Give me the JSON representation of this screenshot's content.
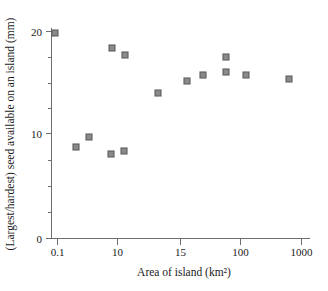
{
  "chart_data": {
    "type": "scatter",
    "title": "",
    "xlabel": "Area of island (km²)",
    "ylabel": "(Largest/hardest) seed available on an island (mm)",
    "xscale": "log-like-categorical",
    "x_tick_labels": [
      "0.1",
      "10",
      "15",
      "100",
      "1000"
    ],
    "y_tick_labels": [
      "0",
      "10",
      "20"
    ],
    "ylim": [
      0,
      21
    ],
    "y_major_ticks": [
      0,
      10,
      20
    ],
    "y_minor_ticks": [
      2.5,
      5,
      7.5,
      12.5,
      15,
      17.5
    ],
    "grid": false,
    "legend": null,
    "marker": "square",
    "marker_color": "#8a8a8a",
    "marker_edge_color": "#5d5d5d",
    "points": [
      {
        "x_label": "0.08",
        "x_px": 55,
        "y": 19.6,
        "y_px": 33
      },
      {
        "x_label": "0.5",
        "x_px": 76,
        "y": 8.7,
        "y_px": 147
      },
      {
        "x_label": "2",
        "x_px": 89,
        "y": 9.9,
        "y_px": 137
      },
      {
        "x_label": "9",
        "x_px": 112,
        "y": 17.8,
        "y_px": 48
      },
      {
        "x_label": "9.5",
        "x_px": 111,
        "y": 7.9,
        "y_px": 154
      },
      {
        "x_label": "11",
        "x_px": 125,
        "y": 17.2,
        "y_px": 55
      },
      {
        "x_label": "11.5",
        "x_px": 124,
        "y": 8.2,
        "y_px": 151
      },
      {
        "x_label": "13",
        "x_px": 158,
        "y": 13.6,
        "y_px": 93
      },
      {
        "x_label": "15.5",
        "x_px": 187,
        "y": 14.7,
        "y_px": 81
      },
      {
        "x_label": "17",
        "x_px": 203,
        "y": 15.3,
        "y_px": 75
      },
      {
        "x_label": "19",
        "x_px": 226,
        "y": 16.5,
        "y_px": 57
      },
      {
        "x_label": "19.5",
        "x_px": 226,
        "y": 15.5,
        "y_px": 72
      },
      {
        "x_label": "110",
        "x_px": 246,
        "y": 15.3,
        "y_px": 75
      },
      {
        "x_label": "700",
        "x_px": 289,
        "y": 14.9,
        "y_px": 79
      }
    ],
    "axis": {
      "x_axis_y_px": 238,
      "y_axis_x_px": 51,
      "x_tick_px": [
        57,
        117,
        180,
        240,
        301
      ],
      "y_tick_px": {
        "0": 238,
        "10": 133,
        "20": 31
      }
    }
  }
}
